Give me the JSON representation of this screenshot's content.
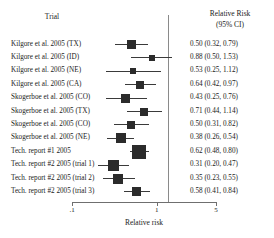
{
  "header": {
    "trial_label": "Trial",
    "rr_label": "Relative Risk",
    "ci_label": "(95% CI)"
  },
  "axis": {
    "title": "Relative risk",
    "tick_labels": [
      ".1",
      "1",
      "5"
    ],
    "tick_values": [
      0.1,
      1,
      5
    ],
    "scale": "log",
    "xmin": 0.1,
    "xmax": 5,
    "reference_line": 1
  },
  "chart_data": {
    "type": "forest",
    "title": "",
    "xlabel": "Relative risk",
    "ylabel": "",
    "xscale": "log",
    "xlim": [
      0.1,
      5
    ],
    "xticks": [
      0.1,
      1,
      5
    ],
    "xticklabels": [
      ".1",
      "1",
      "5"
    ],
    "reference_line": 1,
    "grid": false,
    "legend": "none",
    "columns": [
      "Trial",
      "Relative Risk (95% CI)"
    ],
    "categories": [
      "Kilgore et al. 2005 (TX)",
      "Kilgore et al. 2005 (ID)",
      "Kilgore et al. 2005 (NE)",
      "Kilgore et al. 2005 (CA)",
      "Skogerboe et al. 2005 (CO)",
      "Skogerboe et al. 2005 (TX)",
      "Skogerboe et al. 2005 (CO)",
      "Skogerboe et al. 2005 (NE)",
      "Tech. report #1 2005",
      "Tech. report #2 2005 (trial 1)",
      "Tech. report #2 2005 (trial 2)",
      "Tech. report #2 2005 (trial 3)"
    ],
    "estimates": [
      0.5,
      0.88,
      0.53,
      0.64,
      0.43,
      0.71,
      0.5,
      0.38,
      0.62,
      0.31,
      0.35,
      0.58
    ],
    "ci_lower": [
      0.32,
      0.5,
      0.25,
      0.42,
      0.25,
      0.44,
      0.31,
      0.26,
      0.48,
      0.2,
      0.23,
      0.41
    ],
    "ci_upper": [
      0.79,
      1.53,
      1.12,
      0.97,
      0.76,
      1.14,
      0.82,
      0.54,
      0.8,
      0.47,
      0.55,
      0.84
    ],
    "value_labels": [
      "0.50 (0.32, 0.79)",
      "0.88 (0.50, 1.53)",
      "0.53 (0.25, 1.12)",
      "0.64 (0.42, 0.97)",
      "0.43 (0.25, 0.76)",
      "0.71 (0.44, 1.14)",
      "0.50 (0.31, 0.82)",
      "0.38 (0.26, 0.54)",
      "0.62 (0.48, 0.80)",
      "0.31 (0.20, 0.47)",
      "0.35 (0.23, 0.55)",
      "0.58 (0.41, 0.84)"
    ],
    "marker_weights": [
      9,
      6,
      6,
      8,
      9,
      8,
      8,
      10,
      14,
      11,
      10,
      9
    ]
  }
}
